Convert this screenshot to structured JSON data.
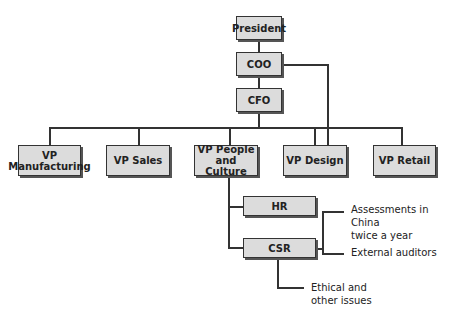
{
  "chart": {
    "nodes": {
      "president": "President",
      "coo": "COO",
      "cfo": "CFO",
      "vp_manufacturing": "VP Manufacturing",
      "vp_sales": "VP Sales",
      "vp_people_culture": "VP People and Culture",
      "vp_design": "VP Design",
      "vp_retail": "VP Retail",
      "hr": "HR",
      "csr": "CSR"
    },
    "vp_manufacturing_lines": [
      "VP",
      "Manufacturing"
    ],
    "vp_people_culture_lines": [
      "VP People",
      "and Culture"
    ],
    "notes": {
      "assessments_lines": [
        "Assessments in China",
        "twice a year"
      ],
      "external_auditors": "External auditors",
      "ethical_lines": [
        "Ethical and",
        "other issues"
      ]
    }
  }
}
